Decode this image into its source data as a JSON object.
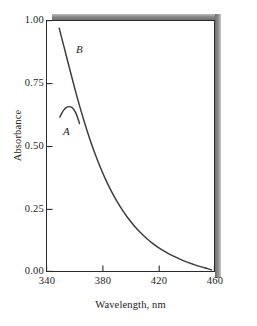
{
  "chart_data": {
    "type": "line",
    "title": "",
    "xlabel": "Wavelength, nm",
    "ylabel": "Absorbance",
    "xlim": [
      340,
      460
    ],
    "ylim": [
      0.0,
      1.0
    ],
    "xticks": [
      "340",
      "380",
      "420",
      "460"
    ],
    "yticks": [
      "1.00",
      "0.75",
      "0.50",
      "0.25",
      "0.00"
    ],
    "grid": false,
    "legend_position": "inline-annotation",
    "line_color": "#3a3a3a",
    "series": [
      {
        "name": "A",
        "label": "A",
        "annotation_x": 352,
        "annotation_y": 0.56,
        "points": [
          [
            349.5,
            0.615
          ],
          [
            351.0,
            0.632
          ],
          [
            352.5,
            0.645
          ],
          [
            354.0,
            0.653
          ],
          [
            356.0,
            0.657
          ],
          [
            358.0,
            0.654
          ],
          [
            359.5,
            0.645
          ],
          [
            361.0,
            0.63
          ],
          [
            362.5,
            0.608
          ],
          [
            363.5,
            0.59
          ]
        ]
      },
      {
        "name": "B",
        "label": "B",
        "annotation_x": 361,
        "annotation_y": 0.885,
        "points": [
          [
            349.0,
            0.97
          ],
          [
            352.0,
            0.905
          ],
          [
            355.0,
            0.84
          ],
          [
            358.0,
            0.775
          ],
          [
            361.0,
            0.712
          ],
          [
            364.0,
            0.652
          ],
          [
            367.0,
            0.596
          ],
          [
            370.0,
            0.543
          ],
          [
            373.0,
            0.494
          ],
          [
            376.0,
            0.449
          ],
          [
            379.0,
            0.407
          ],
          [
            382.0,
            0.369
          ],
          [
            385.0,
            0.334
          ],
          [
            388.0,
            0.302
          ],
          [
            391.0,
            0.273
          ],
          [
            394.0,
            0.246
          ],
          [
            397.0,
            0.222
          ],
          [
            400.0,
            0.2
          ],
          [
            404.0,
            0.173
          ],
          [
            408.0,
            0.15
          ],
          [
            412.0,
            0.129
          ],
          [
            416.0,
            0.111
          ],
          [
            420.0,
            0.095
          ],
          [
            425.0,
            0.078
          ],
          [
            430.0,
            0.063
          ],
          [
            435.0,
            0.05
          ],
          [
            440.0,
            0.038
          ],
          [
            445.0,
            0.028
          ],
          [
            450.0,
            0.019
          ],
          [
            455.0,
            0.011
          ],
          [
            458.0,
            0.006
          ]
        ]
      }
    ]
  }
}
